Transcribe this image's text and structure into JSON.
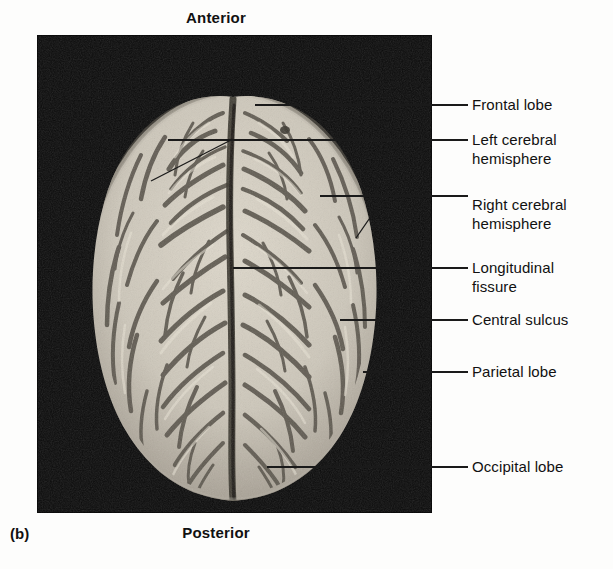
{
  "figure": {
    "panel_letter": "(b)",
    "orientation": {
      "top": "Anterior",
      "bottom": "Posterior"
    },
    "view": "superior-view-of-brain-photograph",
    "colors": {
      "photo_background": "#0c0c0c",
      "brain_tissue": "#cfc9bd",
      "sulcus_shadow": "#4a463f",
      "leader_line": "#1a1a1a",
      "text": "#111111",
      "page_background": "#fdfdfc"
    },
    "photo_panel": {
      "x": 37,
      "y": 35,
      "width": 395,
      "height": 478
    }
  },
  "callouts": [
    {
      "id": "frontal-lobe",
      "label": "Frontal lobe",
      "text_x": 472,
      "text_y": 95,
      "line": [
        [
          255,
          105
        ],
        [
          468,
          105
        ]
      ]
    },
    {
      "id": "left-cerebral-hemisphere",
      "label": "Left cerebral\nhemisphere",
      "text_x": 472,
      "text_y": 130,
      "line": [
        [
          168,
          140
        ],
        [
          468,
          140
        ]
      ],
      "extra_line": [
        [
          151,
          181
        ],
        [
          231,
          140
        ]
      ]
    },
    {
      "id": "right-cerebral-hemisphere",
      "label": "Right cerebral\nhemisphere",
      "text_x": 472,
      "text_y": 195,
      "line": [
        [
          320,
          196
        ],
        [
          468,
          196
        ]
      ],
      "extra_line": [
        [
          356,
          238
        ],
        [
          385,
          196
        ]
      ]
    },
    {
      "id": "longitudinal-fissure",
      "label": "Longitudinal\nfissure",
      "text_x": 472,
      "text_y": 258,
      "line": [
        [
          233,
          268
        ],
        [
          468,
          268
        ]
      ]
    },
    {
      "id": "central-sulcus",
      "label": "Central sulcus",
      "text_x": 472,
      "text_y": 310,
      "line": [
        [
          340,
          320
        ],
        [
          468,
          320
        ]
      ]
    },
    {
      "id": "parietal-lobe",
      "label": "Parietal lobe",
      "text_x": 472,
      "text_y": 362,
      "line": [
        [
          363,
          372
        ],
        [
          468,
          372
        ]
      ]
    },
    {
      "id": "occipital-lobe",
      "label": "Occipital lobe",
      "text_x": 472,
      "text_y": 457,
      "line": [
        [
          267,
          467
        ],
        [
          468,
          467
        ]
      ]
    }
  ]
}
